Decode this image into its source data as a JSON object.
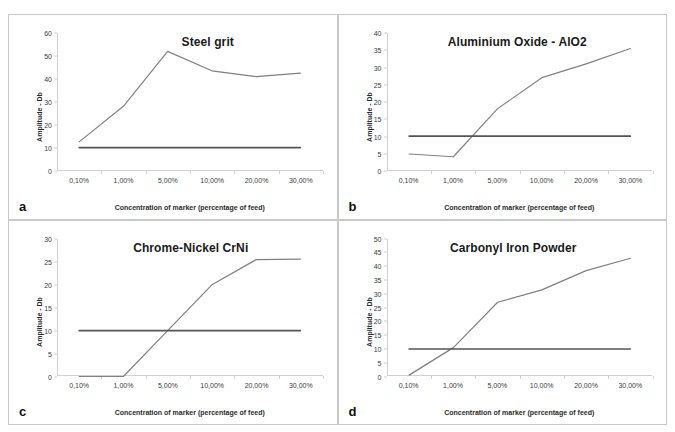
{
  "figure": {
    "background": "#ffffff",
    "data_line_color": "#808080",
    "threshold_line_color": "#555555",
    "axis_color": "#d0d0d0"
  },
  "common": {
    "xlabel": "Concentration of marker (percentage of feed)",
    "ylabel": "Amplitude - Db",
    "categories": [
      "0,10%",
      "1,00%",
      "5,00%",
      "10,00%",
      "20,00%",
      "30,00%"
    ],
    "threshold_series_name": "Detection threshold",
    "signal_series_name": "Amplitude"
  },
  "panels": [
    {
      "letter": "a",
      "title": "Steel grit",
      "ylabel": "Amplitude - Db",
      "xlabel": "Concentration of marker (percentage of feed)"
    },
    {
      "letter": "b",
      "title": "Aluminium Oxide - AlO2",
      "ylabel": "Amplitude - Db",
      "xlabel": "Concentration of marker (percentage of feed)"
    },
    {
      "letter": "c",
      "title": "Chrome-Nickel CrNi",
      "ylabel": "Amplitude - Db",
      "xlabel": "Concentration of marker (percentage of feed)"
    },
    {
      "letter": "d",
      "title": "Carbonyl Iron Powder",
      "ylabel": "Amplitude - Db",
      "xlabel": "Concentration of marker (percentage of feed)"
    }
  ],
  "chart_data": [
    {
      "type": "line",
      "title": "Steel grit",
      "panel": "a",
      "xlabel": "Concentration of marker (percentage of feed)",
      "ylabel": "Amplitude - Db",
      "categories": [
        "0,10%",
        "1,00%",
        "5,00%",
        "10,00%",
        "20,00%",
        "30,00%"
      ],
      "ylim": [
        0,
        60
      ],
      "ytick_step": 10,
      "yticks": [
        0,
        10,
        20,
        30,
        40,
        50,
        60
      ],
      "grid": false,
      "legend": "none",
      "series": [
        {
          "name": "Amplitude",
          "color": "#808080",
          "values": [
            12.5,
            28.0,
            52.0,
            43.5,
            41.0,
            42.5
          ]
        },
        {
          "name": "Detection threshold",
          "color": "#555555",
          "values": [
            10,
            10,
            10,
            10,
            10,
            10
          ]
        }
      ]
    },
    {
      "type": "line",
      "title": "Aluminium Oxide - AlO2",
      "panel": "b",
      "xlabel": "Concentration of marker (percentage of feed)",
      "ylabel": "Amplitude - Db",
      "categories": [
        "0,10%",
        "1,00%",
        "5,00%",
        "10,00%",
        "20,00%",
        "30,00%"
      ],
      "ylim": [
        0,
        40
      ],
      "ytick_step": 5,
      "yticks": [
        0,
        5,
        10,
        15,
        20,
        25,
        30,
        35,
        40
      ],
      "grid": false,
      "legend": "none",
      "series": [
        {
          "name": "Amplitude",
          "color": "#808080",
          "values": [
            4.8,
            4.0,
            18.0,
            27.0,
            31.0,
            35.5
          ]
        },
        {
          "name": "Detection threshold",
          "color": "#555555",
          "values": [
            10,
            10,
            10,
            10,
            10,
            10
          ]
        }
      ]
    },
    {
      "type": "line",
      "title": "Chrome-Nickel CrNi",
      "panel": "c",
      "xlabel": "Concentration of marker (percentage of feed)",
      "ylabel": "Amplitude - Db",
      "categories": [
        "0,10%",
        "1,00%",
        "5,00%",
        "10,00%",
        "20,00%",
        "30,00%"
      ],
      "ylim": [
        0,
        30
      ],
      "ytick_step": 5,
      "yticks": [
        0,
        5,
        10,
        15,
        20,
        25,
        30
      ],
      "grid": false,
      "legend": "none",
      "series": [
        {
          "name": "Amplitude",
          "color": "#808080",
          "values": [
            0.0,
            0.0,
            10.0,
            20.0,
            25.5,
            25.6
          ]
        },
        {
          "name": "Detection threshold",
          "color": "#555555",
          "values": [
            10,
            10,
            10,
            10,
            10,
            10
          ]
        }
      ]
    },
    {
      "type": "line",
      "title": "Carbonyl Iron Powder",
      "panel": "d",
      "xlabel": "Concentration of marker (percentage of feed)",
      "ylabel": "Amplitude - Db",
      "categories": [
        "0,10%",
        "1,00%",
        "5,00%",
        "10,00%",
        "20,00%",
        "30,00%"
      ],
      "ylim": [
        0,
        50
      ],
      "ytick_step": 5,
      "yticks": [
        0,
        5,
        10,
        15,
        20,
        25,
        30,
        35,
        40,
        45,
        50
      ],
      "grid": false,
      "legend": "none",
      "series": [
        {
          "name": "Amplitude",
          "color": "#808080",
          "values": [
            0.5,
            10.5,
            27.0,
            31.5,
            38.5,
            43.0
          ]
        },
        {
          "name": "Detection threshold",
          "color": "#555555",
          "values": [
            10,
            10,
            10,
            10,
            10,
            10
          ]
        }
      ]
    }
  ]
}
